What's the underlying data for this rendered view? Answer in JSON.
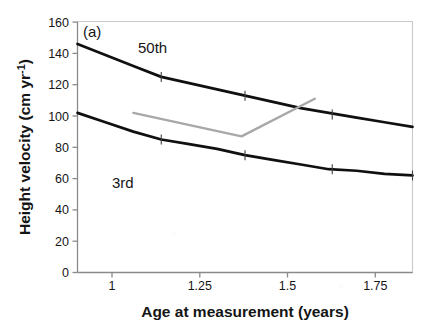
{
  "panel": {
    "label": "(a)"
  },
  "axes": {
    "x": {
      "title": "Age at measurement (years)",
      "ticks": [
        "1",
        "1.25",
        "1.5",
        "1.75"
      ],
      "tickvalues": [
        1,
        1.25,
        1.5,
        1.75
      ],
      "min": 0.9,
      "max": 1.86
    },
    "y": {
      "title": "Height velocity (cm yr",
      "title_sup": "-1",
      "title_tail": ")",
      "title_full": "Height velocity (cm yr⁻¹)",
      "ticks": [
        "0",
        "20",
        "40",
        "60",
        "80",
        "100",
        "120",
        "140",
        "160"
      ],
      "tickvalues": [
        0,
        20,
        40,
        60,
        80,
        100,
        120,
        140,
        160
      ],
      "min": 0,
      "max": 160
    }
  },
  "series_labels": {
    "p50": "50th",
    "p3": "3rd"
  },
  "colors": {
    "curve": "#101010",
    "patient": "#a8a8a8",
    "axis": "#7a7a7a",
    "text": "#151515"
  },
  "chart_data": {
    "type": "line",
    "title": "",
    "subtitle": "",
    "xlabel": "Age at measurement (years)",
    "ylabel": "Height velocity (cm yr⁻¹)",
    "xlim": [
      0.9,
      1.86
    ],
    "ylim": [
      0,
      160
    ],
    "xticks": [
      1,
      1.25,
      1.5,
      1.75
    ],
    "yticks": [
      0,
      20,
      40,
      60,
      80,
      100,
      120,
      140,
      160
    ],
    "grid": false,
    "legend": "none (inline curve annotations)",
    "annotations": [
      {
        "text": "(a)",
        "x": 0.93,
        "y": 153,
        "role": "panel-label"
      },
      {
        "text": "50th",
        "x": 1.08,
        "y": 139,
        "role": "curve-label"
      },
      {
        "text": "3rd",
        "x": 1.06,
        "y": 73,
        "role": "curve-label"
      }
    ],
    "series": [
      {
        "name": "50th",
        "role": "reference-centile",
        "color": "#101010",
        "x": [
          0.9,
          0.98,
          1.06,
          1.14,
          1.22,
          1.3,
          1.38,
          1.46,
          1.54,
          1.62,
          1.7,
          1.78,
          1.86
        ],
        "values": [
          146,
          139,
          132,
          125,
          121,
          117,
          113,
          109,
          105,
          102,
          99,
          96,
          93
        ]
      },
      {
        "name": "3rd",
        "role": "reference-centile",
        "color": "#101010",
        "x": [
          0.9,
          0.98,
          1.06,
          1.14,
          1.22,
          1.3,
          1.38,
          1.46,
          1.54,
          1.62,
          1.7,
          1.78,
          1.86
        ],
        "values": [
          102,
          96,
          90,
          85,
          82,
          79,
          75,
          72,
          69,
          66,
          65,
          63,
          62
        ]
      },
      {
        "name": "patient",
        "role": "individual-measurement-track",
        "color": "#a8a8a8",
        "x": [
          1.06,
          1.37,
          1.58
        ],
        "values": [
          102,
          87,
          111
        ]
      }
    ],
    "series_markers": {
      "50th": [
        {
          "x": 1.14,
          "y": 125
        },
        {
          "x": 1.38,
          "y": 113
        },
        {
          "x": 1.63,
          "y": 101
        }
      ],
      "3rd": [
        {
          "x": 1.14,
          "y": 85
        },
        {
          "x": 1.38,
          "y": 75
        },
        {
          "x": 1.63,
          "y": 66
        },
        {
          "x": 1.86,
          "y": 62
        }
      ]
    }
  }
}
